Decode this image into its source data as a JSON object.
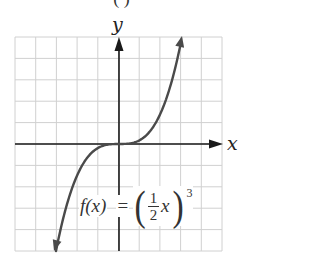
{
  "chart_data": {
    "type": "line",
    "title": "",
    "top_partial_label": "( )",
    "xlabel": "x",
    "ylabel": "y",
    "function": "f(x) = ((1/2) x)^3",
    "formula_parts": {
      "lhs": "f(x)",
      "equals": "=",
      "open_paren": "(",
      "frac_num": "1",
      "frac_den": "2",
      "var": "x",
      "close_paren": ")",
      "exponent": "3"
    },
    "grid": true,
    "grid_cells_x": 10,
    "grid_cells_y": 10,
    "xlim": [
      -5,
      5
    ],
    "ylim": [
      -5,
      5
    ],
    "axis_arrows": true,
    "curve_end_arrows": true,
    "curve_range_x": [
      -3.1,
      3.05
    ],
    "series": [
      {
        "name": "f(x)",
        "x": [
          -3.1,
          -3,
          -2.5,
          -2,
          -1.5,
          -1,
          -0.5,
          0,
          0.5,
          1,
          1.5,
          2,
          2.5,
          3,
          3.05
        ],
        "values_note": "visual shape: y rises steeply beyond |x|>2, flat near origin"
      }
    ],
    "colors": {
      "curve": "#4a4a4a",
      "axes": "#1a1a1a",
      "grid": "#d0d0d0",
      "text": "#333333"
    }
  }
}
